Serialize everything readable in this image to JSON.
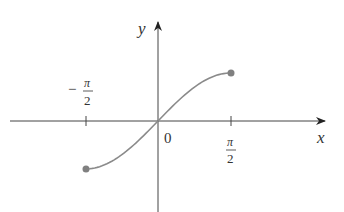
{
  "chart_data": {
    "type": "line",
    "title": "",
    "function": "y = sin(x), -π/2 ≤ x ≤ π/2",
    "xlabel": "x",
    "ylabel": "y",
    "x_tick_labels": [
      {
        "value": -1.5708,
        "label_num": "π",
        "label_den": "2",
        "sign": "−"
      },
      {
        "value": 0,
        "label": "0"
      },
      {
        "value": 1.5708,
        "label_num": "π",
        "label_den": "2",
        "sign": ""
      }
    ],
    "x": [
      -1.5708,
      -1.2566,
      -0.9425,
      -0.6283,
      -0.3142,
      0,
      0.3142,
      0.6283,
      0.9425,
      1.2566,
      1.5708
    ],
    "y": [
      -1,
      -0.9511,
      -0.809,
      -0.5878,
      -0.309,
      0,
      0.309,
      0.5878,
      0.809,
      0.9511,
      1
    ],
    "endpoints": [
      {
        "x": -1.5708,
        "y": -1,
        "style": "closed"
      },
      {
        "x": 1.5708,
        "y": 1,
        "style": "closed"
      }
    ],
    "grid": false,
    "legend": null,
    "colors": {
      "curve": "#8a8a8a",
      "axes": "#333333",
      "dots": "#808080"
    }
  },
  "labels": {
    "y_axis": "y",
    "x_axis": "x",
    "origin": "0",
    "neg_half_pi_sign": "−",
    "pi": "π",
    "two": "2"
  }
}
